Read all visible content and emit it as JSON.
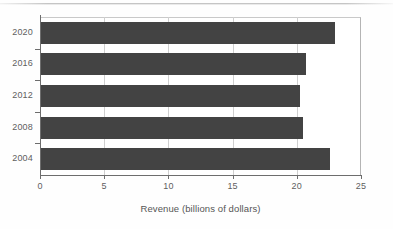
{
  "chart_data": {
    "type": "bar",
    "orientation": "horizontal",
    "title": "",
    "subtitle": "",
    "xlabel": "Revenue (billions of dollars)",
    "ylabel": "",
    "categories": [
      "2004",
      "2008",
      "2012",
      "2016",
      "2020"
    ],
    "values": [
      22.5,
      20.4,
      20.2,
      20.6,
      22.9
    ],
    "series": [
      {
        "name": "Revenue",
        "values": [
          22.5,
          20.4,
          20.2,
          20.6,
          22.9
        ]
      }
    ],
    "xlim": [
      0,
      25
    ],
    "xticks": [
      0,
      5,
      10,
      15,
      20,
      25
    ],
    "xtick_labels": [
      "0",
      "5",
      "10",
      "15",
      "20",
      "25"
    ],
    "grid": "vertical",
    "legend": "none",
    "bar_color": "#434343",
    "grid_color": "#cfcfcf",
    "axis_color": "#6d6d6d",
    "frame_color": "#c9c9c9",
    "background_color": "#ffffff",
    "annotations": []
  }
}
